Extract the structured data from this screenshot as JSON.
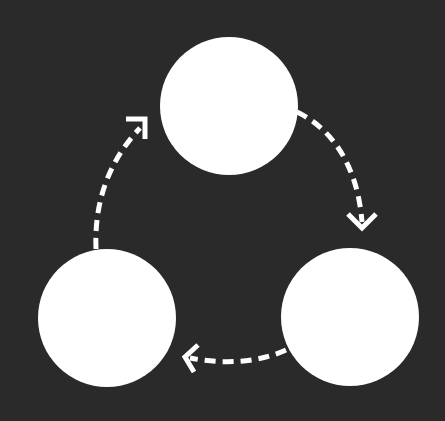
{
  "diagram": {
    "type": "cycle",
    "background": "#2a2a2a",
    "node_color": "#ffffff",
    "edge_color": "#ffffff",
    "edge_style": "dashed",
    "nodes": [
      {
        "id": "top",
        "label": "",
        "cx": 229,
        "cy": 106,
        "r": 69
      },
      {
        "id": "bottom-right",
        "label": "",
        "cx": 350,
        "cy": 317,
        "r": 69
      },
      {
        "id": "bottom-left",
        "label": "",
        "cx": 107,
        "cy": 318,
        "r": 69
      }
    ],
    "edges": [
      {
        "from": "top",
        "to": "bottom-right",
        "direction": "clockwise"
      },
      {
        "from": "bottom-right",
        "to": "bottom-left",
        "direction": "clockwise"
      },
      {
        "from": "bottom-left",
        "to": "top",
        "direction": "clockwise"
      }
    ]
  }
}
